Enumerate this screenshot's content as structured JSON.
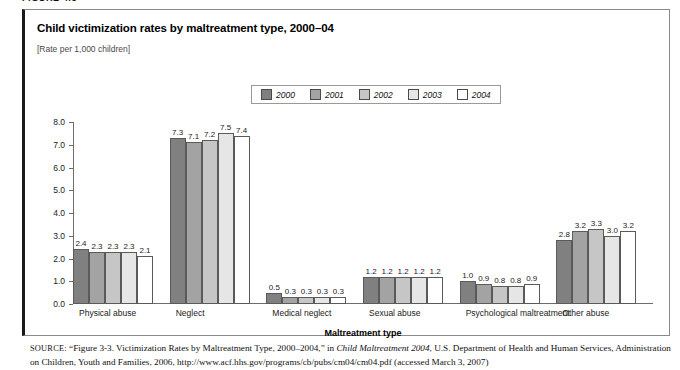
{
  "figure": {
    "label": "FIGURE 4.3"
  },
  "chart": {
    "title": "Child victimization rates by maltreatment type, 2000–04",
    "subtitle": "[Rate per 1,000 children]"
  },
  "source": {
    "label": "SOURCE:",
    "text_part1": " “Figure 3-3. Victimization Rates by Maltreatment Type, 2000–2004,” in ",
    "italic_title": "Child Maltreatment 2004",
    "text_part2": ", U.S. Department of Health and Human Services, Administration on Children, Youth and Families, 2006, http://www.acf.hhs.gov/programs/cb/pubs/cm04/cm04.pdf (accessed March 3, 2007)"
  },
  "colors": {
    "series_2000": "#808080",
    "series_2001": "#a3a3a3",
    "series_2002": "#c6c6c6",
    "series_2003": "#e6e6e6",
    "series_2004": "#ffffff",
    "axis": "#6d6d6d",
    "border": "#5a5a5a",
    "frame_left": "#1a1a1a"
  },
  "chart_data": {
    "type": "bar",
    "title": "Child victimization rates by maltreatment type, 2000–04",
    "subtitle": "[Rate per 1,000 children]",
    "xlabel": "Maltreatment type",
    "ylabel": "",
    "ylim": [
      0.0,
      8.0
    ],
    "ytick_labels": [
      "0.0",
      "1.0",
      "2.0",
      "3.0",
      "4.0",
      "5.0",
      "6.0",
      "7.0",
      "8.0"
    ],
    "yticks": [
      0.0,
      1.0,
      2.0,
      3.0,
      4.0,
      5.0,
      6.0,
      7.0,
      8.0
    ],
    "grid": false,
    "legend_position": "top-center",
    "categories": [
      "Physical abuse",
      "Neglect",
      "Medical neglect",
      "Sexual abuse",
      "Psychological maltreatment",
      "Other abuse"
    ],
    "series": [
      {
        "name": "2000",
        "color": "#808080",
        "values": [
          2.4,
          7.3,
          0.5,
          1.2,
          1.0,
          2.8
        ],
        "labels": [
          "2.4",
          "7.3",
          "0.5",
          "1.2",
          "1.0",
          "2.8"
        ]
      },
      {
        "name": "2001",
        "color": "#a3a3a3",
        "values": [
          2.3,
          7.1,
          0.3,
          1.2,
          0.9,
          3.2
        ],
        "labels": [
          "2.3",
          "7.1",
          "0.3",
          "1.2",
          "0.9",
          "3.2"
        ]
      },
      {
        "name": "2002",
        "color": "#c6c6c6",
        "values": [
          2.3,
          7.2,
          0.3,
          1.2,
          0.8,
          3.3
        ],
        "labels": [
          "2.3",
          "7.2",
          "0.3",
          "1.2",
          "0.8",
          "3.3"
        ]
      },
      {
        "name": "2003",
        "color": "#e6e6e6",
        "values": [
          2.3,
          7.5,
          0.3,
          1.2,
          0.8,
          3.0
        ],
        "labels": [
          "2.3",
          "7.5",
          "0.3",
          "1.2",
          "0.8",
          "3.0"
        ]
      },
      {
        "name": "2004",
        "color": "#ffffff",
        "values": [
          2.1,
          7.4,
          0.3,
          1.2,
          0.9,
          3.2
        ],
        "labels": [
          "2.1",
          "7.4",
          "0.3",
          "1.2",
          "0.9",
          "3.2"
        ]
      }
    ]
  }
}
